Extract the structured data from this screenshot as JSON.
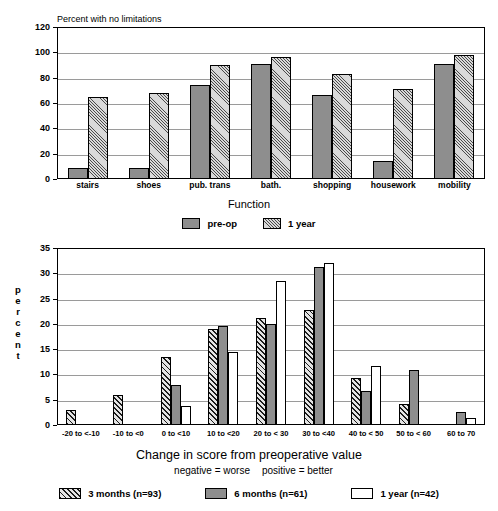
{
  "chart_data": [
    {
      "type": "bar",
      "title": "Percent with no limitations",
      "xlabel": "Function",
      "ylabel": "",
      "ylim": [
        0,
        120
      ],
      "yticks": [
        0,
        20,
        40,
        60,
        80,
        100,
        120
      ],
      "grid": true,
      "legend_position": "bottom",
      "categories": [
        "stairs",
        "shoes",
        "pub. trans",
        "bath.",
        "shopping",
        "housework",
        "mobility"
      ],
      "series": [
        {
          "name": "pre-op",
          "values": [
            9,
            9,
            74,
            91,
            66,
            14,
            91
          ],
          "fill": "solid-gray"
        },
        {
          "name": "1 year",
          "values": [
            65,
            68,
            90,
            96,
            83,
            71,
            98
          ],
          "fill": "fine-diagonal-hatch"
        }
      ]
    },
    {
      "type": "bar",
      "title": "",
      "xlabel": "Change in score from preoperative value",
      "xlabel_note_left": "negative = worse",
      "xlabel_note_right": "positive = better",
      "ylabel": "percent",
      "ylim": [
        0,
        35
      ],
      "yticks": [
        0,
        5,
        10,
        15,
        20,
        25,
        30,
        35
      ],
      "grid": true,
      "legend_position": "bottom",
      "categories": [
        "-20 to <-10",
        "-10 to <0",
        "0 to <10",
        "10 to <20",
        "20 to < 30",
        "30 to <40",
        "40 to < 50",
        "50 to < 60",
        "60 to 70"
      ],
      "series": [
        {
          "name": "3 months (n=93)",
          "values": [
            2.9,
            5.9,
            13.5,
            19.0,
            21.1,
            22.8,
            9.2,
            4.1,
            0
          ],
          "fill": "bold-diagonal-hatch"
        },
        {
          "name": "6 months (n=61)",
          "values": [
            0,
            0,
            8.0,
            19.5,
            20.0,
            31.2,
            6.8,
            10.8,
            2.5
          ],
          "fill": "solid-gray"
        },
        {
          "name": "1 year (n=42)",
          "values": [
            0,
            0,
            3.7,
            14.4,
            28.4,
            32.1,
            11.6,
            0,
            1.4
          ],
          "fill": "white"
        }
      ]
    }
  ],
  "chart1": {
    "title": "Percent with no limitations",
    "xlabel": "Function",
    "yticks": [
      "0",
      "20",
      "40",
      "60",
      "80",
      "100",
      "120"
    ],
    "categories": [
      "stairs",
      "shoes",
      "pub. trans",
      "bath.",
      "shopping",
      "housework",
      "mobility"
    ],
    "legend": [
      {
        "label": "pre-op",
        "fill": "solid-gray"
      },
      {
        "label": "1 year",
        "fill": "fine-diagonal-hatch"
      }
    ]
  },
  "chart2": {
    "ylabel_letters": [
      "p",
      "e",
      "r",
      "c",
      "e",
      "n",
      "t"
    ],
    "xlabel": "Change in score from preoperative value",
    "note_left": "negative = worse",
    "note_right": "positive = better",
    "yticks": [
      "0",
      "5",
      "10",
      "15",
      "20",
      "25",
      "30",
      "35"
    ],
    "categories": [
      "-20 to <-10",
      "-10 to <0",
      "0 to <10",
      "10 to <20",
      "20 to < 30",
      "30 to <40",
      "40 to < 50",
      "50 to < 60",
      "60 to 70"
    ],
    "legend": [
      {
        "label": "3 months (n=93)",
        "fill": "bold-diagonal-hatch"
      },
      {
        "label": "6 months (n=61)",
        "fill": "solid-gray"
      },
      {
        "label": "1 year (n=42)",
        "fill": "white"
      }
    ]
  },
  "colors": {
    "solid_gray": "#8e8e8e",
    "hatch_light_bg": "#d9d9d9",
    "axis_black": "#000000",
    "gridline_gray": "#9a9a9a"
  }
}
